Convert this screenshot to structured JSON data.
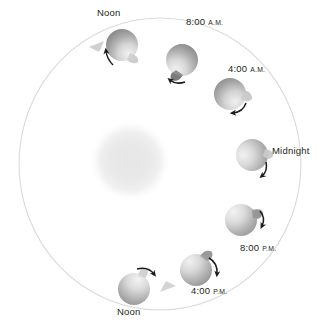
{
  "figure": {
    "background_color": "#ffffff",
    "orbit": {
      "center_x": 160,
      "center_y": 164,
      "radius_x": 141,
      "radius_y": 146,
      "stroke_color": "#d8d8d8",
      "stroke_width": 1,
      "direction": "counterclockwise",
      "direction_marker_count": 2
    },
    "sun": {
      "name": "sun",
      "center_x": 130,
      "center_y": 161,
      "radius": 36,
      "fill_color": "#ececec",
      "edge": "soft-blur"
    },
    "earth_colors": {
      "dark": "#8d8d8d",
      "mid": "#b4b4b4",
      "light": "#e9e9e9",
      "outline": "#9a9a9a",
      "arrow": "#1a1a1a"
    },
    "labels": {
      "noon_top": "Noon",
      "eight_am_time": "8:00",
      "eight_am_meridiem": "A.M.",
      "four_am_time": "4:00",
      "four_am_meridiem": "A.M.",
      "midnight": "Midnight",
      "eight_pm_time": "8:00",
      "eight_pm_meridiem": "P.M.",
      "four_pm_time": "4:00",
      "four_pm_meridiem": "P.M.",
      "noon_bottom": "Noon"
    },
    "earths": [
      {
        "name": "earth-noon-top",
        "label": "Noon",
        "cx": 122,
        "cy": 45,
        "r": 16,
        "light_from": "bottom-right",
        "bulge_angle_deg": 60,
        "spin_arrow": "ccw-lower-left"
      },
      {
        "name": "earth-8am",
        "label": "8:00 A.M.",
        "cx": 182,
        "cy": 60,
        "r": 16,
        "light_from": "bottom-left",
        "bulge_angle_deg": 115,
        "spin_arrow": "ccw-lower-left"
      },
      {
        "name": "earth-4am",
        "label": "4:00 A.M.",
        "cx": 230,
        "cy": 94,
        "r": 16,
        "light_from": "bottom-right",
        "bulge_angle_deg": 20,
        "spin_arrow": "ccw-bottom"
      },
      {
        "name": "earth-midnight",
        "label": "Midnight",
        "cx": 252,
        "cy": 155,
        "r": 16,
        "light_from": "left",
        "bulge_angle_deg": 0,
        "spin_arrow": "ccw-lower-right"
      },
      {
        "name": "earth-8pm",
        "label": "8:00 P.M.",
        "cx": 241,
        "cy": 220,
        "r": 16,
        "light_from": "top-left",
        "bulge_angle_deg": -35,
        "spin_arrow": "ccw-right"
      },
      {
        "name": "earth-4pm",
        "label": "4:00 P.M.",
        "cx": 196,
        "cy": 270,
        "r": 16,
        "light_from": "top-left",
        "bulge_angle_deg": -70,
        "spin_arrow": "ccw-upper-right"
      },
      {
        "name": "earth-noon-bottom",
        "label": "Noon",
        "cx": 134,
        "cy": 289,
        "r": 16,
        "light_from": "top-right",
        "bulge_angle_deg": -120,
        "spin_arrow": "ccw-top"
      }
    ]
  }
}
